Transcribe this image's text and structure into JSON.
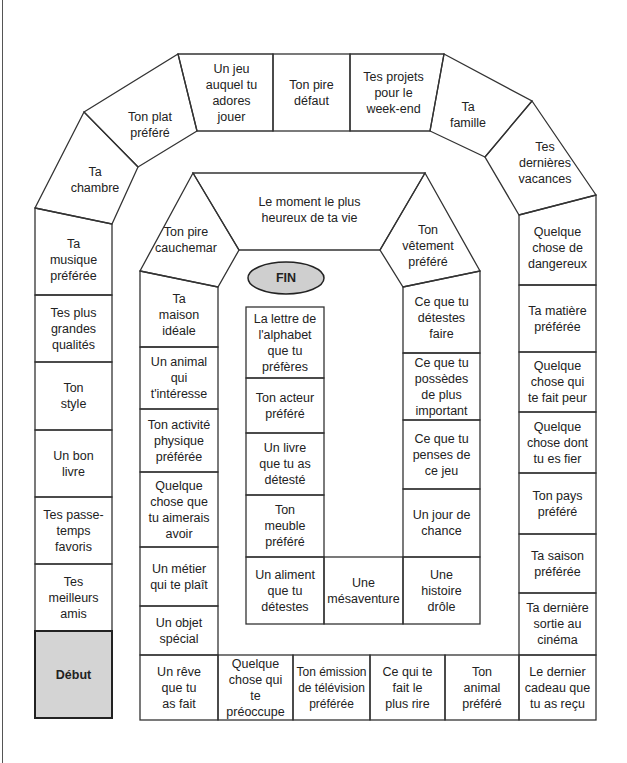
{
  "board": {
    "title": "",
    "start_label": "Début",
    "end_label": "FIN",
    "colors": {
      "line": "#333333",
      "start_fill": "#d4d4d4",
      "end_fill": "#cfcfcf",
      "background": "#ffffff"
    },
    "outer_ring": [
      {
        "id": "debut",
        "text": "Début"
      },
      {
        "id": "meilleurs-amis",
        "text": "Tes meilleurs amis"
      },
      {
        "id": "passe-temps",
        "text": "Tes passe-temps favoris"
      },
      {
        "id": "bon-livre",
        "text": "Un bon livre"
      },
      {
        "id": "style",
        "text": "Ton style"
      },
      {
        "id": "qualites",
        "text": "Tes plus grandes qualités"
      },
      {
        "id": "musique",
        "text": "Ta musique préférée"
      },
      {
        "id": "chambre",
        "text": "Ta chambre"
      },
      {
        "id": "plat",
        "text": "Ton plat préféré"
      },
      {
        "id": "jeu",
        "text": "Un jeu auquel tu adores jouer"
      },
      {
        "id": "defaut",
        "text": "Ton pire défaut"
      },
      {
        "id": "projets",
        "text": "Tes projets pour le week-end"
      },
      {
        "id": "famille",
        "text": "Ta famille"
      },
      {
        "id": "vacances",
        "text": "Tes dernières vacances"
      },
      {
        "id": "dangereux",
        "text": "Quelque chose de dangereux"
      },
      {
        "id": "matiere",
        "text": "Ta matière préférée"
      },
      {
        "id": "peur",
        "text": "Quelque chose qui te fait peur"
      },
      {
        "id": "fier",
        "text": "Quelque chose dont tu es fier"
      },
      {
        "id": "pays",
        "text": "Ton pays préféré"
      },
      {
        "id": "saison",
        "text": "Ta saison préférée"
      },
      {
        "id": "cinema",
        "text": "Ta dernière sortie au cinéma"
      },
      {
        "id": "cadeau",
        "text": "Le dernier cadeau que tu as reçu"
      }
    ],
    "middle_ring": [
      {
        "id": "animal-prefere",
        "text": "Ton animal préféré"
      },
      {
        "id": "rire",
        "text": "Ce qui te fait le plus rire"
      },
      {
        "id": "emission",
        "text": "Ton émission de télévision préférée"
      },
      {
        "id": "preoccupe",
        "text": "Quelque chose qui te préoccupe"
      },
      {
        "id": "reve",
        "text": "Un rêve que tu as fait"
      },
      {
        "id": "objet",
        "text": "Un objet spécial"
      },
      {
        "id": "metier",
        "text": "Un métier qui te plaît"
      },
      {
        "id": "aimerais",
        "text": "Quelque chose que tu aimerais avoir"
      },
      {
        "id": "activite",
        "text": "Ton activité physique préférée"
      },
      {
        "id": "animal-interesse",
        "text": "Un animal qui t'intéresse"
      },
      {
        "id": "maison",
        "text": "Ta maison idéale"
      },
      {
        "id": "cauchemar",
        "text": "Ton pire cauchemar"
      },
      {
        "id": "moment",
        "text": "Le moment le plus heureux de ta vie"
      },
      {
        "id": "vetement",
        "text": "Ton vêtement préféré"
      }
    ],
    "inner_ring": [
      {
        "id": "detestes-faire",
        "text": "Ce que tu détestes faire"
      },
      {
        "id": "possedes",
        "text": "Ce que tu possèdes de plus important"
      },
      {
        "id": "penses",
        "text": "Ce que tu penses de ce jeu"
      },
      {
        "id": "chance",
        "text": "Un jour de chance"
      },
      {
        "id": "histoire",
        "text": "Une histoire drôle"
      },
      {
        "id": "mesaventure",
        "text": "Une mésaventure"
      },
      {
        "id": "aliment",
        "text": "Un aliment que tu détestes"
      },
      {
        "id": "meuble",
        "text": "Ton meuble préféré"
      },
      {
        "id": "livre-deteste",
        "text": "Un livre que tu as détesté"
      },
      {
        "id": "acteur",
        "text": "Ton acteur préféré"
      },
      {
        "id": "lettre",
        "text": "La lettre de l'alphabet que tu préfères"
      }
    ]
  }
}
